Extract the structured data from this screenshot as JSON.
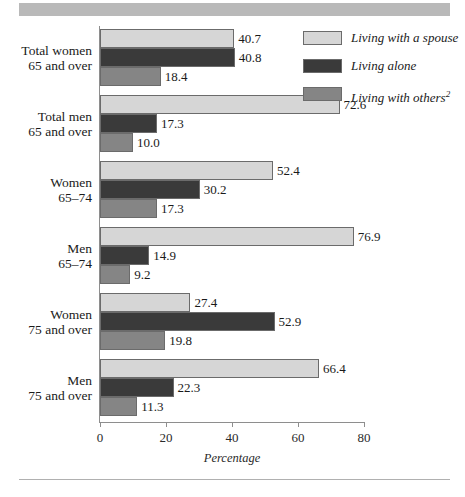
{
  "chart_data": {
    "type": "bar",
    "orientation": "horizontal",
    "title": "",
    "xlabel": "Percentage",
    "ylabel": "",
    "xlim": [
      0,
      80
    ],
    "xticks": [
      0,
      20,
      40,
      60,
      80
    ],
    "grid": false,
    "legend_position": "top-right",
    "categories": [
      "Total women 65 and over",
      "Total men 65 and over",
      "Women 65–74",
      "Men 65–74",
      "Women 75 and over",
      "Men 75 and over"
    ],
    "series": [
      {
        "name": "Living with a spouse",
        "color": "#d6d6d6",
        "values": [
          40.7,
          72.6,
          52.4,
          76.9,
          27.4,
          66.4
        ]
      },
      {
        "name": "Living alone",
        "color": "#3a3a3a",
        "values": [
          40.8,
          17.3,
          30.2,
          14.9,
          52.9,
          22.3
        ]
      },
      {
        "name": "Living with others",
        "color": "#858585",
        "values": [
          18.4,
          10.0,
          17.3,
          9.2,
          19.8,
          11.3
        ]
      }
    ]
  },
  "categories_display": [
    {
      "line1": "Total women",
      "line2": "65 and over"
    },
    {
      "line1": "Total men",
      "line2": "65 and over"
    },
    {
      "line1": "Women",
      "line2": "65–74"
    },
    {
      "line1": "Men",
      "line2": "65–74"
    },
    {
      "line1": "Women",
      "line2": "75 and over"
    },
    {
      "line1": "Men",
      "line2": "75 and over"
    }
  ],
  "legend": {
    "items": [
      {
        "label": "Living with a spouse",
        "footnote": "",
        "swatch": "spouse"
      },
      {
        "label": "Living alone",
        "footnote": "",
        "swatch": "alone"
      },
      {
        "label": "Living with others",
        "footnote": "2",
        "swatch": "others"
      }
    ]
  },
  "axis": {
    "x_title": "Percentage",
    "x_tick_labels": [
      "0",
      "20",
      "40",
      "60",
      "80"
    ]
  },
  "bar_value_labels": [
    [
      "40.7",
      "40.8",
      "18.4"
    ],
    [
      "72.6",
      "17.3",
      "10.0"
    ],
    [
      "52.4",
      "30.2",
      "17.3"
    ],
    [
      "76.9",
      "14.9",
      "9.2"
    ],
    [
      "27.4",
      "52.9",
      "19.8"
    ],
    [
      "66.4",
      "22.3",
      "11.3"
    ]
  ],
  "colors": {
    "spouse": "#d6d6d6",
    "alone": "#3a3a3a",
    "others": "#858585",
    "axis": "#8e8e8e",
    "band": "#b9b9b9"
  }
}
